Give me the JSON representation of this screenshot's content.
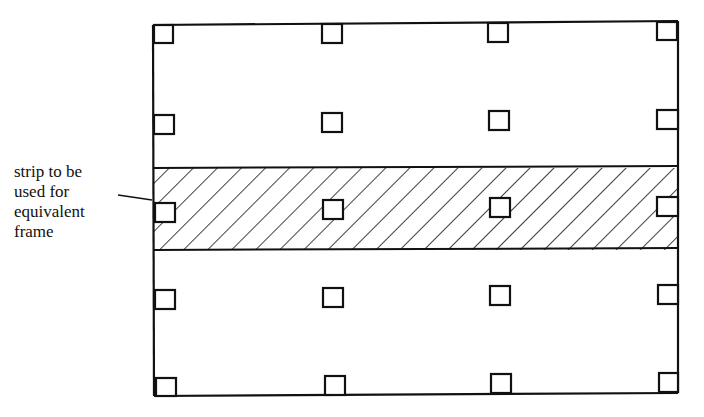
{
  "figure": {
    "type": "slab-plan-diagram",
    "background": "#ffffff",
    "stroke_color": "#111111",
    "annotation": {
      "lines": [
        "strip to be",
        "used for",
        "equivalent",
        "frame"
      ]
    },
    "slab_outline": {
      "x": 153,
      "y": 22,
      "width": 525,
      "height": 375
    },
    "column_grid": {
      "columns_x": [
        153,
        322,
        490,
        658
      ],
      "rows_y": [
        24,
        117,
        202,
        290,
        380
      ],
      "column_size": 20
    },
    "hatched_strip": {
      "label": "strip to be used for equivalent frame",
      "y_top": 168,
      "y_bottom": 250,
      "hatch_spacing": 17,
      "hatch_angle_deg": 45
    },
    "leader_line": {
      "x1": 118,
      "y1": 196,
      "x2": 152,
      "y2": 202
    }
  }
}
